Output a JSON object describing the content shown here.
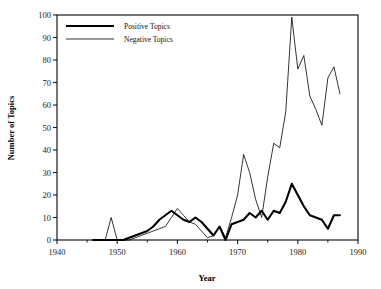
{
  "chart_data": {
    "type": "line",
    "title": "",
    "xlabel": "Year",
    "ylabel": "Number of Topics",
    "xlim": [
      1940,
      1990
    ],
    "ylim": [
      0,
      100
    ],
    "xticks": [
      1940,
      1950,
      1960,
      1970,
      1980,
      1990
    ],
    "xtick_labels": [
      "1940",
      "1950",
      "1960",
      "1970",
      "1980",
      "1990"
    ],
    "xminor_ticks": [
      1945,
      1955,
      1965,
      1975,
      1985
    ],
    "yticks": [
      0,
      10,
      20,
      30,
      40,
      50,
      60,
      70,
      80,
      90,
      100
    ],
    "ytick_labels": [
      "0",
      "10",
      "20",
      "30",
      "40",
      "50",
      "60",
      "70",
      "80",
      "90",
      "100"
    ],
    "grid": false,
    "frame": true,
    "legend_position": "top-left-inside",
    "series": [
      {
        "name": "Positive Topics",
        "color": "#000000",
        "linewidth": 2.1,
        "x": [
          1946,
          1947,
          1948,
          1949,
          1950,
          1951,
          1952,
          1953,
          1954,
          1955,
          1956,
          1957,
          1958,
          1959,
          1960,
          1961,
          1962,
          1963,
          1964,
          1965,
          1966,
          1967,
          1968,
          1969,
          1970,
          1971,
          1972,
          1973,
          1974,
          1975,
          1976,
          1977,
          1978,
          1979,
          1980,
          1981,
          1982,
          1983,
          1984,
          1985,
          1986,
          1987
        ],
        "values": [
          0,
          0,
          0,
          0,
          0,
          0,
          1,
          2,
          3,
          4,
          6,
          9,
          11,
          13,
          11,
          9,
          8,
          10,
          8,
          5,
          2,
          6,
          0,
          7,
          8,
          9,
          12,
          10,
          13,
          9,
          13,
          12,
          17,
          25,
          20,
          15,
          11,
          10,
          9,
          5,
          11,
          11
        ]
      },
      {
        "name": "Negative Topics",
        "color": "#000000",
        "linewidth": 0.8,
        "x": [
          1946,
          1947,
          1948,
          1949,
          1950,
          1951,
          1952,
          1953,
          1954,
          1955,
          1956,
          1957,
          1958,
          1959,
          1960,
          1961,
          1962,
          1963,
          1964,
          1965,
          1966,
          1967,
          1968,
          1969,
          1970,
          1971,
          1972,
          1973,
          1974,
          1975,
          1976,
          1977,
          1978,
          1979,
          1980,
          1981,
          1982,
          1983,
          1984,
          1985,
          1986,
          1987
        ],
        "values": [
          0,
          0,
          0,
          10,
          0,
          0,
          0,
          1,
          2,
          3,
          4,
          5,
          6,
          10,
          14,
          11,
          8,
          7,
          4,
          1,
          2,
          6,
          1,
          10,
          20,
          38,
          30,
          18,
          10,
          28,
          43,
          41,
          57,
          99,
          76,
          82,
          64,
          58,
          51,
          72,
          77,
          65
        ]
      }
    ]
  },
  "legend": {
    "entries": [
      {
        "label": "Positive Topics",
        "style": "thick"
      },
      {
        "label": "Negative Topics",
        "style": "thin"
      }
    ]
  }
}
